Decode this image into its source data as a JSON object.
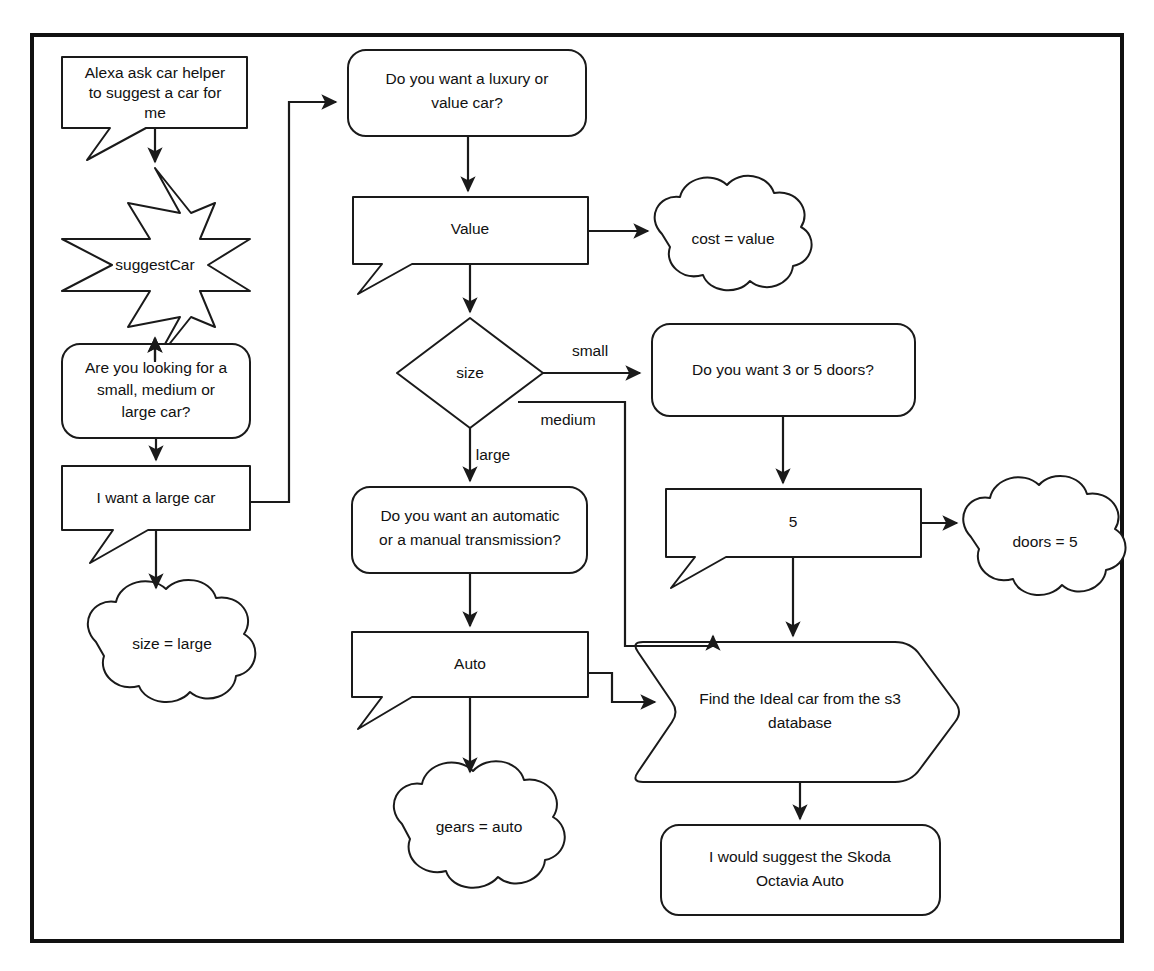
{
  "diagram": {
    "style": {
      "background": "#ffffff",
      "stroke": "#1a1a1a",
      "frame_stroke": "#111111",
      "fill": "#ffffff",
      "text": "#111111"
    },
    "nodes": [
      {
        "id": "utterance",
        "shape": "speech-bubble",
        "lines": [
          "Alexa ask car helper",
          "to suggest a car for",
          "me"
        ]
      },
      {
        "id": "suggest-car",
        "shape": "star-8",
        "lines": [
          "suggestCar"
        ]
      },
      {
        "id": "ask-size",
        "shape": "rounded-rect",
        "lines": [
          "Are you looking for a",
          "small, medium or",
          "large car?"
        ]
      },
      {
        "id": "answer-size",
        "shape": "speech-bubble",
        "lines": [
          "I want a large car"
        ]
      },
      {
        "id": "var-size",
        "shape": "cloud",
        "lines": [
          "size = large"
        ]
      },
      {
        "id": "ask-cost",
        "shape": "rounded-rect",
        "lines": [
          "Do you want a luxury or",
          "value car?"
        ]
      },
      {
        "id": "answer-cost",
        "shape": "speech-bubble",
        "lines": [
          "Value"
        ]
      },
      {
        "id": "var-cost",
        "shape": "cloud",
        "lines": [
          "cost = value"
        ]
      },
      {
        "id": "decision-size",
        "shape": "diamond",
        "lines": [
          "size"
        ]
      },
      {
        "id": "ask-doors",
        "shape": "rounded-rect",
        "lines": [
          "Do you want 3 or 5 doors?"
        ]
      },
      {
        "id": "answer-doors",
        "shape": "speech-bubble",
        "lines": [
          "5"
        ]
      },
      {
        "id": "var-doors",
        "shape": "cloud",
        "lines": [
          "doors = 5"
        ]
      },
      {
        "id": "ask-gears",
        "shape": "rounded-rect",
        "lines": [
          "Do you want an automatic",
          "or a manual transmission?"
        ]
      },
      {
        "id": "answer-gears",
        "shape": "speech-bubble",
        "lines": [
          "Auto"
        ]
      },
      {
        "id": "var-gears",
        "shape": "cloud",
        "lines": [
          "gears = auto"
        ]
      },
      {
        "id": "find-car",
        "shape": "chevron",
        "lines": [
          "Find the Ideal car from the s3",
          "database"
        ]
      },
      {
        "id": "result",
        "shape": "rounded-rect",
        "lines": [
          "I would suggest the Skoda",
          "Octavia Auto"
        ]
      }
    ],
    "edge_labels": [
      {
        "id": "label-small",
        "text": "small"
      },
      {
        "id": "label-medium",
        "text": "medium"
      },
      {
        "id": "label-large",
        "text": "large"
      }
    ]
  }
}
